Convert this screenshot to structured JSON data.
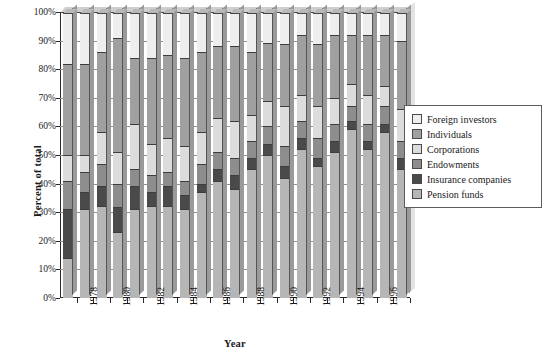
{
  "chart_data": {
    "type": "bar",
    "variant": "stacked-100-percent",
    "title": "",
    "xlabel": "Year",
    "ylabel": "Percent of total",
    "ylim": [
      0,
      100
    ],
    "ytick_labels": [
      "0%",
      "10%",
      "20%",
      "30%",
      "40%",
      "50%",
      "60%",
      "70%",
      "80%",
      "90%",
      "100%"
    ],
    "ytick_values": [
      0,
      10,
      20,
      30,
      40,
      50,
      60,
      70,
      80,
      90,
      100
    ],
    "grid": true,
    "legend_position": "right",
    "x": [
      1977,
      1978,
      1979,
      1980,
      1981,
      1982,
      1983,
      1984,
      1985,
      1986,
      1987,
      1988,
      1989,
      1990,
      1991,
      1992,
      1993,
      1994,
      1995,
      1996,
      1997
    ],
    "categories": [
      "1977",
      "1978",
      "1979",
      "1980",
      "1981",
      "1982",
      "1983",
      "1984",
      "1985",
      "1986",
      "1987",
      "1988",
      "1989",
      "1990",
      "1991",
      "1992",
      "1993",
      "1994",
      "1995",
      "1996",
      "1997"
    ],
    "xtick_labels_shown": [
      "1978",
      "1980",
      "1982",
      "1984",
      "1986",
      "1988",
      "1990",
      "1992",
      "1994",
      "1996"
    ],
    "series": [
      {
        "name": "Pension funds",
        "color": "#b6b6b6",
        "values": [
          14,
          31,
          32,
          23,
          31,
          32,
          32,
          31,
          37,
          41,
          38,
          45,
          50,
          42,
          52,
          46,
          51,
          59,
          52,
          58,
          45
        ]
      },
      {
        "name": "Insurance companies",
        "color": "#4a4a4a",
        "values": [
          17,
          6,
          7,
          9,
          8,
          5,
          7,
          5,
          3,
          4,
          5,
          4,
          4,
          4,
          4,
          3,
          4,
          3,
          3,
          3,
          4
        ]
      },
      {
        "name": "Endowments",
        "color": "#8d8d8d",
        "values": [
          10,
          7,
          8,
          8,
          6,
          6,
          5,
          5,
          7,
          6,
          6,
          6,
          6,
          7,
          6,
          7,
          6,
          5,
          6,
          6,
          6
        ]
      },
      {
        "name": "Corporations",
        "color": "#dcdcdc",
        "values": [
          9,
          6,
          11,
          11,
          16,
          11,
          12,
          12,
          11,
          12,
          13,
          9,
          9,
          14,
          9,
          11,
          9,
          8,
          10,
          7,
          11
        ]
      },
      {
        "name": "Individuals",
        "color": "#a0a0a0",
        "values": [
          32,
          32,
          28,
          40,
          23,
          30,
          29,
          31,
          28,
          25,
          26,
          22,
          20,
          22,
          21,
          22,
          22,
          17,
          21,
          18,
          24
        ]
      },
      {
        "name": "Foreign investors",
        "color": "#eeeeee",
        "values": [
          18,
          18,
          14,
          9,
          16,
          16,
          15,
          16,
          14,
          12,
          12,
          14,
          11,
          11,
          8,
          11,
          8,
          8,
          8,
          8,
          10
        ]
      }
    ],
    "legend_order": [
      "Foreign investors",
      "Individuals",
      "Corporations",
      "Endowments",
      "Insurance companies",
      "Pension funds"
    ],
    "stack_order_bottom_to_top": [
      "Pension funds",
      "Insurance companies",
      "Endowments",
      "Corporations",
      "Individuals",
      "Foreign investors"
    ]
  },
  "legend": {
    "items": [
      {
        "label": "Foreign investors",
        "color": "#eeeeee"
      },
      {
        "label": "Individuals",
        "color": "#a0a0a0"
      },
      {
        "label": "Corporations",
        "color": "#dcdcdc"
      },
      {
        "label": "Endowments",
        "color": "#8d8d8d"
      },
      {
        "label": "Insurance companies",
        "color": "#4a4a4a"
      },
      {
        "label": "Pension funds",
        "color": "#b6b6b6"
      }
    ]
  }
}
